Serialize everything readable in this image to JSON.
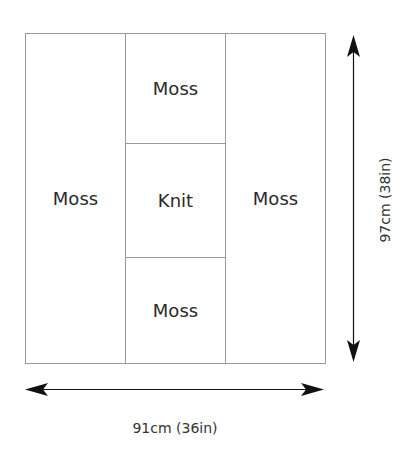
{
  "diagram": {
    "panels": [
      {
        "label": "Moss",
        "position": "left"
      },
      {
        "label": "Moss",
        "position": "center-top"
      },
      {
        "label": "Knit",
        "position": "center-middle"
      },
      {
        "label": "Moss",
        "position": "center-bottom"
      },
      {
        "label": "Moss",
        "position": "right"
      }
    ],
    "height_dimension": "97cm (38in)",
    "width_dimension": "91cm (36in)"
  }
}
